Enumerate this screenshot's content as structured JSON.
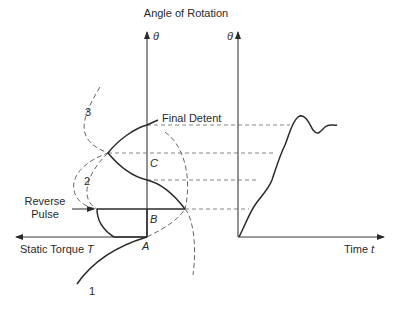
{
  "title": "Angle of Rotation",
  "left_axis": {
    "y_label": "θ",
    "x_label": "Static Torque",
    "x_symbol": "T"
  },
  "right_axis": {
    "y_label": "θ",
    "x_label": "Time",
    "x_symbol": "t"
  },
  "points": {
    "A": "A",
    "B": "B",
    "C": "C"
  },
  "curve_labels": {
    "c1": "1",
    "c2": "2",
    "c3": "3"
  },
  "annotations": {
    "final_detent": "Final Detent",
    "reverse_pulse_line1": "Reverse",
    "reverse_pulse_line2": "Pulse"
  },
  "colors": {
    "line": "#2a2a2a",
    "dashed": "#666666",
    "background": "#ffffff"
  }
}
